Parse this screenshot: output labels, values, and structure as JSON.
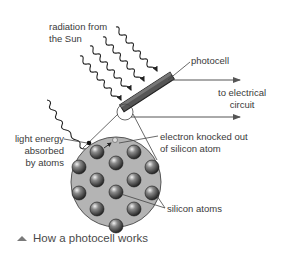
{
  "diagram": {
    "title": "How a photocell works",
    "labels": {
      "radiation_line1": "radiation from",
      "radiation_line2": "the Sun",
      "photocell": "photocell",
      "circuit_line1": "to electrical",
      "circuit_line2": "circuit",
      "electron_line1": "electron knocked out",
      "electron_line2": "of silicon atom",
      "light_line1": "light energy",
      "light_line2": "absorbed",
      "light_line3": "by atoms",
      "silicon": "silicon atoms"
    },
    "caption": {
      "icon": "triangle-up-icon",
      "text": "How a photocell works"
    },
    "colors": {
      "line": "#333333",
      "photocell": "#555555",
      "circle_fill": "#b4b4b4",
      "atom": "#5a5a5a",
      "text": "#3a3a3a"
    }
  }
}
